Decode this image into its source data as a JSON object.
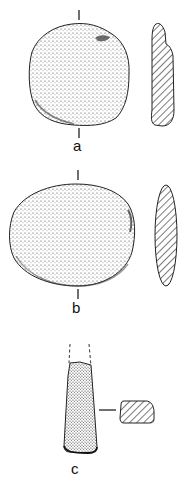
{
  "figure": {
    "artifacts": [
      {
        "id": "a",
        "label": "a",
        "view": "face with profile section"
      },
      {
        "id": "b",
        "label": "b",
        "view": "face with profile section"
      },
      {
        "id": "c",
        "label": "c",
        "view": "face with cross-section"
      }
    ],
    "colors": {
      "ink": "#1a1a1a",
      "background": "#ffffff"
    }
  }
}
